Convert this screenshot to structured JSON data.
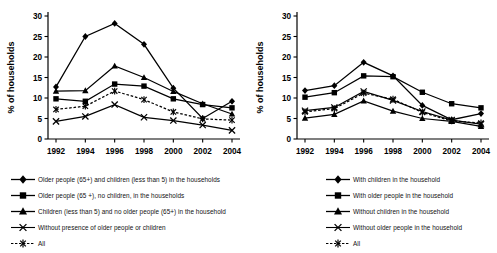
{
  "figure": {
    "background": "#ffffff",
    "line_color": "#000000",
    "panels": 2
  },
  "chart_data": [
    {
      "type": "line",
      "panel": "left",
      "title": "",
      "xlabel": "",
      "ylabel": "% of households",
      "x": [
        1992,
        1994,
        1996,
        1998,
        2000,
        2002,
        2004
      ],
      "xticks": [
        "1992",
        "1994",
        "1996",
        "1998",
        "2000",
        "2002",
        "2004"
      ],
      "yticks": [
        "0",
        "5",
        "10",
        "15",
        "20",
        "25",
        "30"
      ],
      "ylim": [
        0,
        30
      ],
      "xlim": [
        1991,
        2005
      ],
      "grid": false,
      "legend_position": "below",
      "series": [
        {
          "name": "Older people (65+)  and children  (less than 5)  in the households",
          "marker": "diamond",
          "dash": "solid",
          "values": [
            12.7,
            25.0,
            28.2,
            23.1,
            12.4,
            5.0,
            9.2
          ]
        },
        {
          "name": "Older people (65 +), no children, in the households",
          "marker": "square",
          "dash": "solid",
          "values": [
            9.8,
            9.2,
            13.4,
            12.9,
            9.8,
            8.4,
            7.6
          ]
        },
        {
          "name": "Children (less than 5) and no older people (65+)  in the household",
          "marker": "triangle",
          "dash": "solid",
          "values": [
            11.7,
            11.8,
            17.8,
            15.0,
            11.6,
            8.6,
            6.1
          ]
        },
        {
          "name": "Without presence of older people or children",
          "marker": "cross",
          "dash": "solid",
          "values": [
            4.3,
            5.5,
            8.4,
            5.3,
            4.5,
            3.4,
            2.1
          ]
        },
        {
          "name": "All",
          "marker": "asterisk",
          "dash": "dashed",
          "values": [
            7.2,
            8.0,
            11.7,
            9.6,
            6.6,
            4.9,
            4.6
          ]
        }
      ]
    },
    {
      "type": "line",
      "panel": "right",
      "title": "",
      "xlabel": "",
      "ylabel": "% of households",
      "x": [
        1992,
        1994,
        1996,
        1998,
        2000,
        2002,
        2004
      ],
      "xticks": [
        "1992",
        "1994",
        "1996",
        "1998",
        "2000",
        "2002",
        "2004"
      ],
      "yticks": [
        "0",
        "5",
        "10",
        "15",
        "20",
        "25",
        "30"
      ],
      "ylim": [
        0,
        30
      ],
      "xlim": [
        1991,
        2005
      ],
      "grid": false,
      "legend_position": "below",
      "series": [
        {
          "name": "With children in the household",
          "marker": "diamond",
          "dash": "solid",
          "values": [
            11.8,
            13.0,
            18.7,
            15.4,
            8.2,
            4.7,
            6.2
          ]
        },
        {
          "name": "With older people in  the household",
          "marker": "square",
          "dash": "solid",
          "values": [
            10.2,
            11.3,
            15.4,
            15.2,
            11.4,
            8.6,
            7.6
          ]
        },
        {
          "name": "Without children in the household",
          "marker": "triangle",
          "dash": "solid",
          "values": [
            5.1,
            6.0,
            9.3,
            6.8,
            5.0,
            4.3,
            3.1
          ]
        },
        {
          "name": "Without older people in  the household",
          "marker": "cross",
          "dash": "solid",
          "values": [
            6.9,
            7.7,
            11.6,
            9.4,
            6.7,
            4.6,
            3.6
          ]
        },
        {
          "name": "All",
          "marker": "asterisk",
          "dash": "dashed",
          "values": [
            6.6,
            7.4,
            11.2,
            9.7,
            6.5,
            4.4,
            3.9
          ]
        }
      ]
    }
  ]
}
